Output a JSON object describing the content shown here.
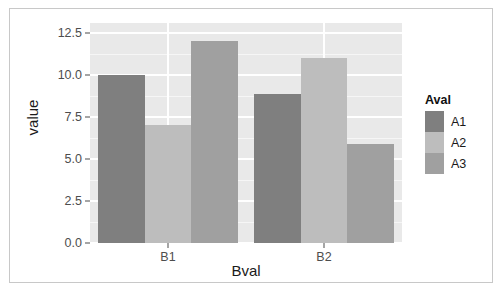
{
  "chart_data": {
    "type": "bar",
    "title": "",
    "xlabel": "Bval",
    "ylabel": "value",
    "categories": [
      "B1",
      "B2"
    ],
    "series": [
      {
        "name": "A1",
        "values": [
          10.0,
          8.9
        ],
        "color": "#7f7f7f"
      },
      {
        "name": "A2",
        "values": [
          7.0,
          11.0
        ],
        "color": "#bdbdbd"
      },
      {
        "name": "A3",
        "values": [
          12.0,
          5.9
        ],
        "color": "#a0a0a0"
      }
    ],
    "ylim": [
      0,
      13.1
    ],
    "yticks": [
      "0.0",
      "2.5",
      "5.0",
      "7.5",
      "10.0",
      "12.5"
    ],
    "ytick_values": [
      0.0,
      2.5,
      5.0,
      7.5,
      10.0,
      12.5
    ],
    "grid": true,
    "legend": {
      "title": "Aval",
      "position": "right",
      "entries": [
        "A1",
        "A2",
        "A3"
      ]
    },
    "panel_background": "#e9e9e9",
    "gridline_color": "#ffffff",
    "frame_color": "#c8c8c8"
  }
}
